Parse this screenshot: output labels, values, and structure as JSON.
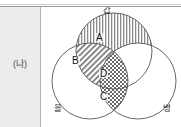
{
  "table": {
    "left_cell_label": "(나)",
    "left_cell_bg": "#ececec",
    "border_color": "#9a9a9a"
  },
  "diagram": {
    "type": "venn-3-circle",
    "circles": [
      {
        "id": "gap",
        "label": "갑",
        "position": "top",
        "cx": 72,
        "cy": 44,
        "r": 38
      },
      {
        "id": "eul",
        "label": "을",
        "position": "bottom-left",
        "cx": 48,
        "cy": 74,
        "r": 38
      },
      {
        "id": "byeong",
        "label": "병",
        "position": "bottom-right",
        "cx": 96,
        "cy": 74,
        "r": 38
      }
    ],
    "regions": [
      {
        "id": "A",
        "label": "A",
        "belongs_to": [
          "갑"
        ],
        "fill": "vertical-stripes"
      },
      {
        "id": "B",
        "label": "B",
        "belongs_to": [
          "갑",
          "을"
        ],
        "fill": "diagonal-hatch"
      },
      {
        "id": "D",
        "label": "D",
        "belongs_to": [
          "갑",
          "을",
          "병"
        ],
        "fill": "checker"
      },
      {
        "id": "C",
        "label": "C",
        "belongs_to": [
          "을",
          "병"
        ],
        "fill": "checker"
      }
    ],
    "stroke_color": "#555555",
    "label_color": "#2b2b2b"
  }
}
